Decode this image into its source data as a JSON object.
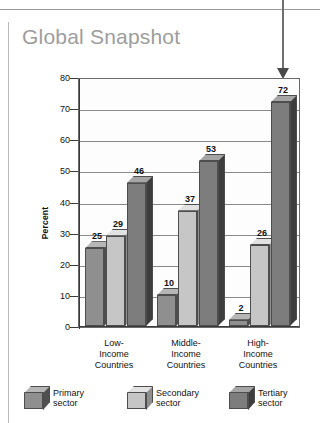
{
  "chart_title": "Global Snapshot",
  "annotation": {
    "callout_arrow": "down-arrow pointing at High-Income tertiary bar"
  },
  "chart_data": {
    "type": "bar",
    "title": "Global Snapshot",
    "xlabel": "",
    "ylabel": "Percent",
    "ylim": [
      0,
      80
    ],
    "yticks": [
      0,
      10,
      20,
      30,
      40,
      50,
      60,
      70,
      80
    ],
    "ytick_labels": [
      "0",
      "10",
      "20",
      "30",
      "40",
      "50",
      "60",
      "70",
      "80"
    ],
    "grid": true,
    "legend_position": "bottom",
    "categories": [
      "Low-\nIncome\nCountries",
      "Middle-\nIncome\nCountries",
      "High-\nIncome\nCountries"
    ],
    "category_lines": [
      [
        "Low-",
        "Income",
        "Countries"
      ],
      [
        "Middle-",
        "Income",
        "Countries"
      ],
      [
        "High-",
        "Income",
        "Countries"
      ]
    ],
    "series": [
      {
        "name": "Primary sector",
        "values": [
          25,
          10,
          2
        ],
        "color": "#8f8f8f"
      },
      {
        "name": "Secondary sector",
        "values": [
          29,
          37,
          26
        ],
        "color": "#c6c6c6"
      },
      {
        "name": "Tertiary sector",
        "values": [
          46,
          53,
          72
        ],
        "color": "#7d7d7d"
      }
    ],
    "data_labels": [
      [
        "25",
        "29",
        "46"
      ],
      [
        "10",
        "37",
        "53"
      ],
      [
        "2",
        "26",
        "72"
      ]
    ]
  },
  "legend": {
    "items": [
      {
        "line1": "Primary",
        "line2": "sector"
      },
      {
        "line1": "Secondary",
        "line2": "sector"
      },
      {
        "line1": "Tertiary",
        "line2": "sector"
      }
    ]
  },
  "colors": {
    "title": "#9d9d9d",
    "primary_sector": "#8f8f8f",
    "secondary_sector": "#c6c6c6",
    "tertiary_sector": "#7d7d7d",
    "axis": "#3a3a3a",
    "grid": "#8a8a8a"
  }
}
